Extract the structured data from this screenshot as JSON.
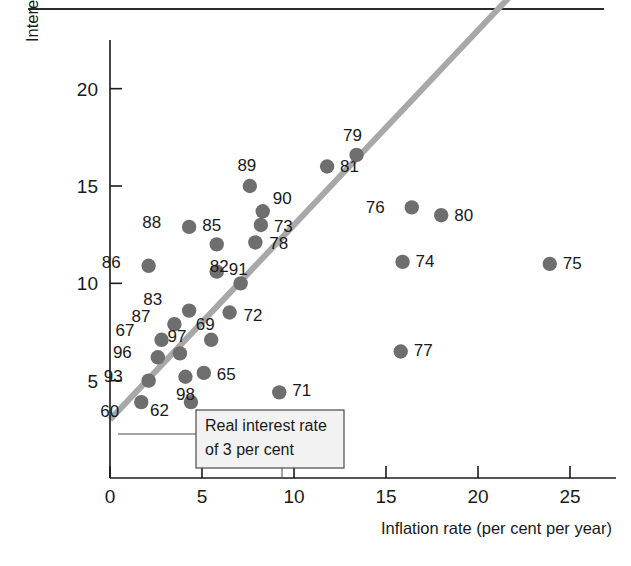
{
  "figure": {
    "top_rule": true
  },
  "chart_data": {
    "type": "scatter",
    "title": "",
    "xlabel": "Inflation rate (per cent per year)",
    "ylabel": "Interest rate (per cent per year)",
    "xlim": [
      0,
      27.5
    ],
    "ylim": [
      0,
      22.5
    ],
    "xticks": [
      0,
      5,
      10,
      15,
      20,
      25
    ],
    "xticklabels": [
      "0",
      "5",
      "10",
      "15",
      "20",
      "25"
    ],
    "yticks": [
      5,
      10,
      15,
      20
    ],
    "yticklabels": [
      "5",
      "10",
      "15",
      "20"
    ],
    "grid": false,
    "legend": null,
    "point_label_field": "year",
    "points": [
      {
        "year": "60",
        "x": 1.7,
        "y": 3.9,
        "label_dx": -22,
        "label_dy": 15
      },
      {
        "year": "62",
        "x": 4.4,
        "y": 3.9,
        "label_dx": -22,
        "label_dy": 14
      },
      {
        "year": "93",
        "x": 2.1,
        "y": 5.0,
        "label_dx": -26,
        "label_dy": 1
      },
      {
        "year": "96",
        "x": 2.6,
        "y": 6.2,
        "label_dx": -26,
        "label_dy": 1
      },
      {
        "year": "67",
        "x": 2.8,
        "y": 7.1,
        "label_dx": -27,
        "label_dy": -4
      },
      {
        "year": "87",
        "x": 3.5,
        "y": 7.9,
        "label_dx": -24,
        "label_dy": -2
      },
      {
        "year": "97",
        "x": 3.8,
        "y": 6.4,
        "label_dx": -3,
        "label_dy": -11
      },
      {
        "year": "83",
        "x": 4.3,
        "y": 8.6,
        "label_dx": -27,
        "label_dy": -6
      },
      {
        "year": "98",
        "x": 4.1,
        "y": 5.2,
        "label_dx": 0,
        "label_dy": 23
      },
      {
        "year": "65",
        "x": 5.1,
        "y": 5.4,
        "label_dx": 13,
        "label_dy": 7
      },
      {
        "year": "69",
        "x": 5.5,
        "y": 7.1,
        "label_dx": -6,
        "label_dy": -10
      },
      {
        "year": "86",
        "x": 2.1,
        "y": 10.9,
        "label_dx": -28,
        "label_dy": 2
      },
      {
        "year": "88",
        "x": 4.3,
        "y": 12.9,
        "label_dx": -28,
        "label_dy": 1
      },
      {
        "year": "85",
        "x": 5.8,
        "y": 12.0,
        "label_dx": -5,
        "label_dy": -13
      },
      {
        "year": "91",
        "x": 5.8,
        "y": 10.6,
        "label_dx": 12,
        "label_dy": 3
      },
      {
        "year": "72",
        "x": 6.5,
        "y": 8.5,
        "label_dx": 14,
        "label_dy": 8
      },
      {
        "year": "82",
        "x": 7.1,
        "y": 10.0,
        "label_dx": -12,
        "label_dy": -11
      },
      {
        "year": "89",
        "x": 7.6,
        "y": 15.0,
        "label_dx": -3,
        "label_dy": -15
      },
      {
        "year": "78",
        "x": 7.9,
        "y": 12.1,
        "label_dx": 14,
        "label_dy": 7
      },
      {
        "year": "73",
        "x": 8.2,
        "y": 13.0,
        "label_dx": 13,
        "label_dy": 7
      },
      {
        "year": "90",
        "x": 8.3,
        "y": 13.7,
        "label_dx": 10,
        "label_dy": -7
      },
      {
        "year": "71",
        "x": 9.2,
        "y": 4.4,
        "label_dx": 13,
        "label_dy": 4
      },
      {
        "year": "81",
        "x": 11.8,
        "y": 16.0,
        "label_dx": 13,
        "label_dy": 5
      },
      {
        "year": "79",
        "x": 13.4,
        "y": 16.6,
        "label_dx": -4,
        "label_dy": -14
      },
      {
        "year": "77",
        "x": 15.8,
        "y": 6.5,
        "label_dx": 13,
        "label_dy": 5
      },
      {
        "year": "74",
        "x": 15.9,
        "y": 11.1,
        "label_dx": 13,
        "label_dy": 5
      },
      {
        "year": "76",
        "x": 16.4,
        "y": 13.9,
        "label_dx": -27,
        "label_dy": 6
      },
      {
        "year": "80",
        "x": 18.0,
        "y": 13.5,
        "label_dx": 13,
        "label_dy": 6
      },
      {
        "year": "75",
        "x": 23.9,
        "y": 11.0,
        "label_dx": 13,
        "label_dy": 5
      }
    ],
    "reference_line": {
      "name": "Real interest rate of 3 per cent",
      "intercept": 3,
      "slope": 1,
      "x_start": 0,
      "x_end": 22.3,
      "color": "#a8a8a8"
    },
    "annotation": {
      "line1": "Real interest rate",
      "line2": "of 3 per cent"
    }
  },
  "colors": {
    "dot": "#6e6e6e",
    "line": "#a8a8a8",
    "axis": "#1a1a1a",
    "annotation_bg": "#f2f2f2"
  }
}
